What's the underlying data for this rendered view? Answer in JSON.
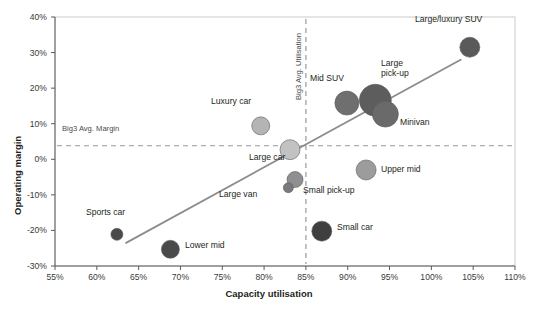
{
  "chart_data": {
    "type": "scatter",
    "title": "",
    "xlabel": "Capacity utilisation",
    "ylabel": "Operating margin",
    "xlim": [
      55,
      110
    ],
    "ylim": [
      -30,
      40
    ],
    "xticks": [
      "55%",
      "60%",
      "65%",
      "70%",
      "75%",
      "80%",
      "85%",
      "90%",
      "95%",
      "100%",
      "105%",
      "110%"
    ],
    "xtick_values": [
      55,
      60,
      65,
      70,
      75,
      80,
      85,
      90,
      95,
      100,
      105,
      110
    ],
    "yticks": [
      "40%",
      "30%",
      "20%",
      "10%",
      "0%",
      "-10%",
      "-20%",
      "-30%"
    ],
    "ytick_values": [
      40,
      30,
      20,
      10,
      0,
      -10,
      -20,
      -30
    ],
    "grid": false,
    "legend": null,
    "bubble_size_encodes": "segment volume",
    "points": [
      {
        "name": "Sports car",
        "x": 62.4,
        "y": -21.1,
        "r": 6,
        "color": "#4a4a4a"
      },
      {
        "name": "Lower mid",
        "x": 68.8,
        "y": -25.3,
        "r": 9,
        "color": "#4a4a4a"
      },
      {
        "name": "Luxury car",
        "x": 79.6,
        "y": 9.4,
        "r": 9,
        "color": "#b4b4b4"
      },
      {
        "name": "Large car",
        "x": 83.1,
        "y": 2.7,
        "r": 10,
        "color": "#c2c2c2"
      },
      {
        "name": "Large van",
        "x": 83.7,
        "y": -5.7,
        "r": 8,
        "color": "#8f8f8f"
      },
      {
        "name": "Large van small",
        "x": 82.9,
        "y": -8.0,
        "r": 5,
        "color": "#7a7a7a"
      },
      {
        "name": "Small car",
        "x": 86.9,
        "y": -20.2,
        "r": 10,
        "color": "#3f3f3f"
      },
      {
        "name": "Mid SUV",
        "x": 89.9,
        "y": 15.8,
        "r": 12,
        "color": "#6f6f6f"
      },
      {
        "name": "Large pick-up",
        "x": 93.3,
        "y": 16.6,
        "r": 16,
        "color": "#5d5d5d"
      },
      {
        "name": "Minivan",
        "x": 94.5,
        "y": 12.7,
        "r": 13,
        "color": "#6a6a6a"
      },
      {
        "name": "Upper mid",
        "x": 92.2,
        "y": -3.0,
        "r": 10,
        "color": "#9c9c9c"
      },
      {
        "name": "Large/luxury SUV",
        "x": 104.6,
        "y": 31.5,
        "r": 10,
        "color": "#5a5a5a"
      }
    ],
    "point_labels": [
      {
        "name": "Large/luxury SUV",
        "text": "Large/luxury SUV",
        "left": 415,
        "top": 14
      },
      {
        "name": "Mid SUV",
        "text": "Mid SUV",
        "left": 310,
        "top": 73
      },
      {
        "name": "Large pick-up",
        "text": "Large\npick-up",
        "left": 381,
        "top": 58
      },
      {
        "name": "Minivan",
        "text": "Minivan",
        "left": 400,
        "top": 117
      },
      {
        "name": "Luxury car",
        "text": "Luxury car",
        "left": 211,
        "top": 96
      },
      {
        "name": "Large car",
        "text": "Large car",
        "left": 249,
        "top": 152
      },
      {
        "name": "Large van",
        "text": "Large van",
        "left": 219,
        "top": 189
      },
      {
        "name": "Small pick-up",
        "text": "Small pick-up",
        "left": 303,
        "top": 185
      },
      {
        "name": "Upper mid",
        "text": "Upper mid",
        "left": 381,
        "top": 164
      },
      {
        "name": "Small car",
        "text": "Small car",
        "left": 337,
        "top": 222
      },
      {
        "name": "Sports car",
        "text": "Sports car",
        "left": 86,
        "top": 207
      },
      {
        "name": "Lower mid",
        "text": "Lower mid",
        "left": 185,
        "top": 240
      }
    ],
    "reference_lines": [
      {
        "name": "Big3 Avg. Margin",
        "orientation": "horizontal",
        "value": 3.8,
        "label": "Big3 Avg. Margin",
        "style": "dashed",
        "color": "#999999"
      },
      {
        "name": "Big3 Avg. Utilisation",
        "orientation": "vertical",
        "value": 85.0,
        "label": "Big3 Avg. Utilisation",
        "style": "dashed",
        "color": "#999999"
      }
    ],
    "trendline": {
      "name": "trend-line",
      "x_start": 63.5,
      "y_start": -23.5,
      "x_end": 103.5,
      "y_end": 28.0,
      "color": "#8c8c8c"
    },
    "colors": {
      "axis": "#5a5a5a",
      "text": "#231f20",
      "reference": "#999999",
      "trend": "#8c8c8c",
      "background": "#ffffff"
    }
  }
}
